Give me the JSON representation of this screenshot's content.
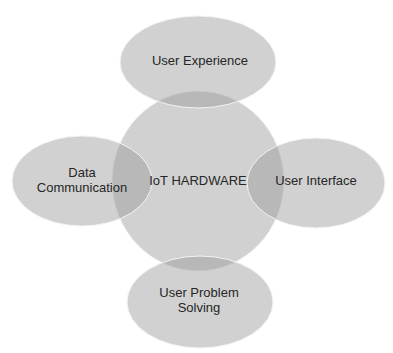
{
  "diagram": {
    "type": "venn-cluster",
    "center": {
      "label": "IoT HARDWARE"
    },
    "satellites": [
      {
        "id": "top",
        "lines": [
          "User Experience"
        ]
      },
      {
        "id": "left",
        "lines": [
          "Data",
          "Communication"
        ]
      },
      {
        "id": "right",
        "lines": [
          "User Interface"
        ]
      },
      {
        "id": "bottom",
        "lines": [
          "User Problem",
          "Solving"
        ]
      }
    ],
    "colors": {
      "fill": "#cfcfcf",
      "overlap": "#a8a8a8",
      "text": "#262626",
      "background": "#ffffff"
    }
  }
}
